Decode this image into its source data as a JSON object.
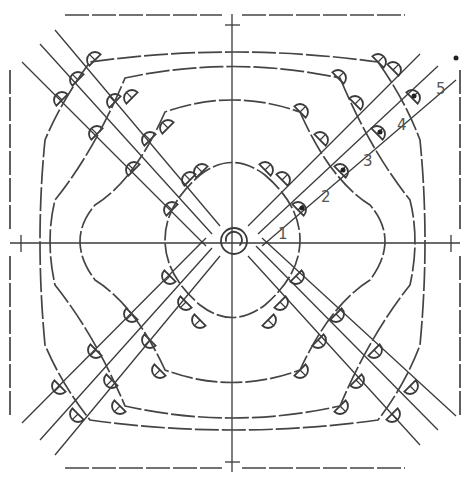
{
  "diagram": {
    "type": "crochet-granny-square-chart",
    "rounds": [
      {
        "label": "1",
        "x": 278,
        "y": 239
      },
      {
        "label": "2",
        "x": 321,
        "y": 202
      },
      {
        "label": "3",
        "x": 363,
        "y": 166
      },
      {
        "label": "4",
        "x": 397,
        "y": 130
      },
      {
        "label": "5",
        "x": 436,
        "y": 94
      }
    ],
    "center": {
      "x": 234,
      "y": 241,
      "symbol": "magic-ring"
    },
    "colors": {
      "line": "#3a3a3a",
      "label": "#555555",
      "background": "#ffffff"
    }
  }
}
